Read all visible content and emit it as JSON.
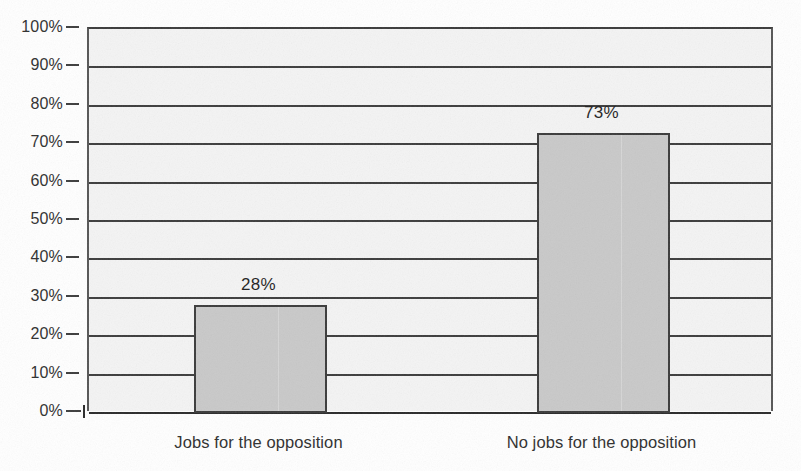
{
  "chart_data": {
    "type": "bar",
    "title": "",
    "subtitle": "",
    "xlabel": "",
    "ylabel": "",
    "categories": [
      "Jobs for the opposition",
      "No jobs for the opposition"
    ],
    "values": [
      28,
      73
    ],
    "value_labels": [
      "28%",
      "73%"
    ],
    "ylim": [
      0,
      100
    ],
    "ytick_values": [
      0,
      10,
      20,
      30,
      40,
      50,
      60,
      70,
      80,
      90,
      100
    ],
    "ytick_labels": [
      "0%",
      "10%",
      "20%",
      "30%",
      "40%",
      "50%",
      "60%",
      "70%",
      "80%",
      "90%",
      "100%"
    ],
    "grid": "horizontal",
    "legend": "none",
    "orientation": "vertical",
    "colors": {
      "bar_fill": "#c9c9c9",
      "bar_border": "#3a3a3a",
      "plot_background": "#f4f4f4",
      "gridline": "#3c3c3c",
      "axis_line": "#2a2a2a",
      "text": "#2e2e2e",
      "page_background": "#ffffff"
    }
  }
}
